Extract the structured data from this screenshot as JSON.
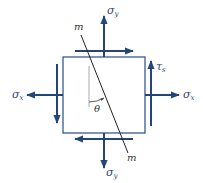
{
  "diagram": {
    "colors": {
      "arrow": "#23457a",
      "square": "#3a5a90",
      "line": "#222222",
      "reference_line": "#aaaaaa"
    },
    "labels": {
      "sigma_y_top": {
        "base": "σ",
        "sub": "y"
      },
      "sigma_y_bottom": {
        "base": "σ",
        "sub": "y"
      },
      "sigma_x_left": {
        "base": "σ",
        "sub": "x"
      },
      "sigma_x_right": {
        "base": "σ",
        "sub": "x"
      },
      "tau": {
        "base": "τ",
        "sub": "s"
      },
      "m_top": "m",
      "m_bottom": "m",
      "theta": "θ"
    }
  }
}
